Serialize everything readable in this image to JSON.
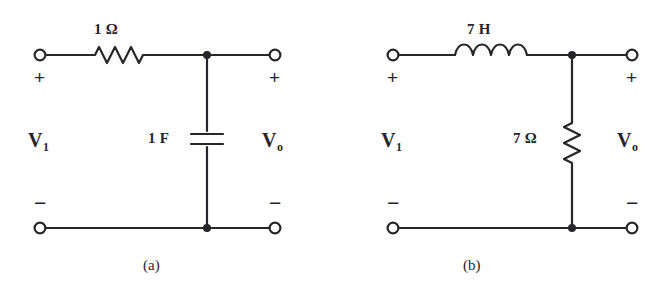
{
  "figure": {
    "type": "circuit-schematic-pair",
    "background_color": "#ffffff",
    "ink_color": "#26262a"
  },
  "circuits": [
    {
      "id": "a",
      "caption": "(a)",
      "input_port": {
        "voltage_label": "V",
        "voltage_subscript": "1",
        "plus": "+",
        "minus": "−"
      },
      "output_port": {
        "voltage_label": "V",
        "voltage_subscript": "o",
        "plus": "+",
        "minus": "−"
      },
      "series_element": {
        "kind": "resistor",
        "icon": "resistor-zigzag-icon",
        "value": "1",
        "unit": "Ω",
        "label": "1 Ω"
      },
      "shunt_element": {
        "kind": "capacitor",
        "icon": "capacitor-plates-icon",
        "value": "1",
        "unit": "F",
        "label": "1 F"
      }
    },
    {
      "id": "b",
      "caption": "(b)",
      "input_port": {
        "voltage_label": "V",
        "voltage_subscript": "1",
        "plus": "+",
        "minus": "−"
      },
      "output_port": {
        "voltage_label": "V",
        "voltage_subscript": "o",
        "plus": "+",
        "minus": "−"
      },
      "series_element": {
        "kind": "inductor",
        "icon": "inductor-coil-icon",
        "value": "7",
        "unit": "H",
        "label": "7 H"
      },
      "shunt_element": {
        "kind": "resistor",
        "icon": "resistor-zigzag-vertical-icon",
        "value": "7",
        "unit": "Ω",
        "label": "7 Ω"
      }
    }
  ]
}
